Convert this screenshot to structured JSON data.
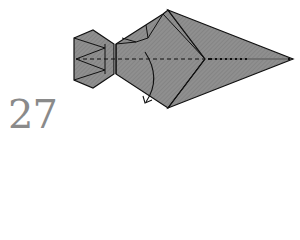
{
  "step": {
    "number": "27"
  },
  "diagram": {
    "colors": {
      "paper": "#8c8c8c",
      "hatch": "#7a7a7a",
      "line": "#111111",
      "background": "#ffffff",
      "step_number": "#8a8a8a"
    },
    "annotations": [
      {
        "type": "valley-fold-line",
        "style": "dashed",
        "orientation": "horizontal"
      },
      {
        "type": "fold-arrow",
        "direction": "down-left"
      }
    ]
  }
}
